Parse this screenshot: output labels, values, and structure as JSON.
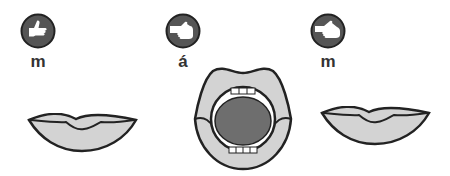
{
  "steps": [
    {
      "label": "m",
      "icon": "thumbs-up-hand-icon",
      "mouth": "closed-lips"
    },
    {
      "label": "á",
      "icon": "pointing-hand-icon",
      "mouth": "open-mouth"
    },
    {
      "label": "m",
      "icon": "flat-hand-icon",
      "mouth": "closed-lips"
    }
  ],
  "colors": {
    "icon_bg": "#555555",
    "lip_fill": "#d3d3d3",
    "tongue": "#6e6e6e",
    "outline": "#222222"
  }
}
